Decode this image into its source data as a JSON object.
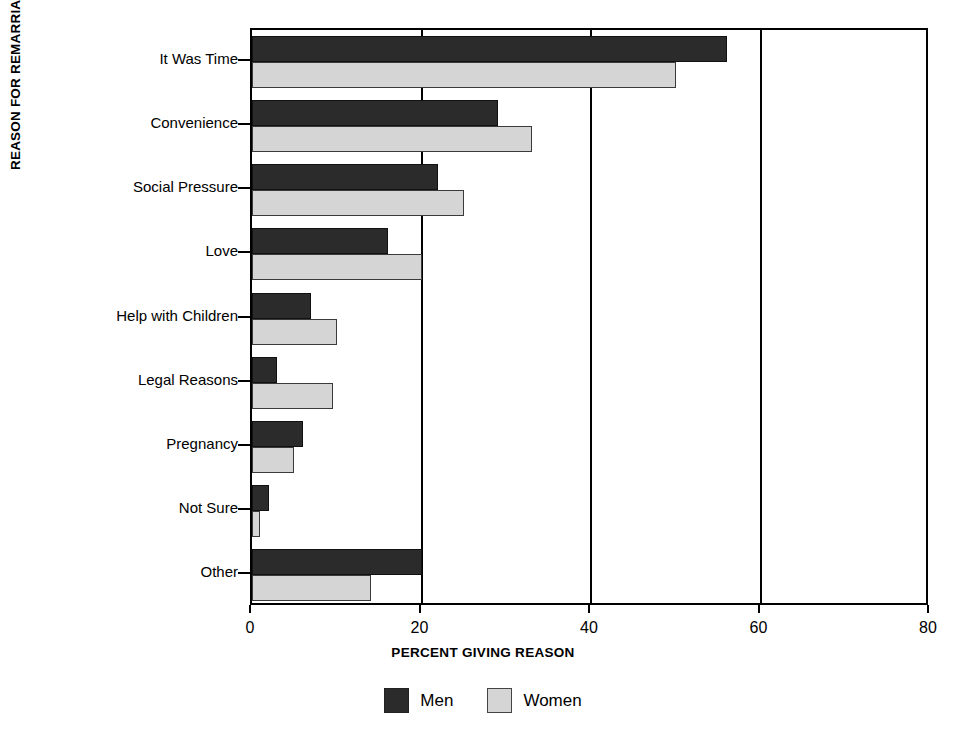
{
  "chart_data": {
    "type": "bar",
    "orientation": "horizontal",
    "title": "",
    "xlabel": "PERCENT GIVING REASON",
    "ylabel": "REASON FOR REMARRIAGE",
    "categories": [
      "It Was Time",
      "Convenience",
      "Social Pressure",
      "Love",
      "Help with Children",
      "Legal Reasons",
      "Pregnancy",
      "Not Sure",
      "Other"
    ],
    "series": [
      {
        "name": "Men",
        "color": "#2b2b2b",
        "values": [
          56,
          29,
          22,
          16,
          7,
          3,
          6,
          2,
          20
        ]
      },
      {
        "name": "Women",
        "color": "#d5d5d5",
        "values": [
          50,
          33,
          25,
          20,
          10,
          9.5,
          5,
          1,
          14
        ]
      }
    ],
    "xlim": [
      0,
      80
    ],
    "xticks": [
      0,
      20,
      40,
      60,
      80
    ],
    "xtick_labels": [
      "0",
      "20",
      "40",
      "60",
      "80"
    ],
    "gridlines": [
      20,
      40,
      60
    ],
    "grid": true,
    "legend_position": "bottom",
    "legend": [
      "Men",
      "Women"
    ]
  }
}
